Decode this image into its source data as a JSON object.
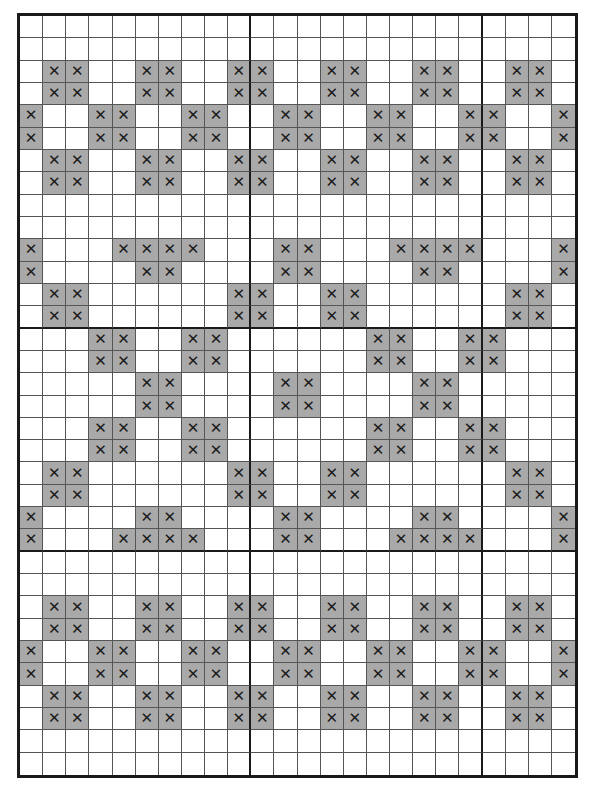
{
  "chart": {
    "type": "cross-stitch-pattern",
    "columns": 24,
    "rows": 34,
    "symbol": "✕",
    "colors": {
      "filled": "#a9a9a9",
      "empty": "#ffffff",
      "grid": "#555555",
      "major_grid": "#1a1a1a"
    },
    "major_lines": {
      "after_columns": [
        9,
        19
      ],
      "after_rows": [
        13,
        23
      ]
    },
    "pattern": [
      "........................",
      "........................",
      ".XX..XX..XX..XX..XX..XX.",
      ".XX..XX..XX..XX..XX..XX.",
      "X..XX..XX..XX..XX..XX..X",
      "X..XX..XX..XX..XX..XX..X",
      ".XX..XX..XX..XX..XX..XX.",
      ".XX..XX..XX..XX..XX..XX.",
      "........................",
      "........................",
      "X...XXXX...XX...XXXX...X",
      "X....XX....XX....XX....X",
      ".XX......XX..XX......XX.",
      ".XX......XX..XX......XX.",
      "...XX..XX......XX..XX...",
      "...XX..XX......XX..XX...",
      ".....XX....XX....XX.....",
      ".....XX....XX....XX.....",
      "...XX..XX......XX..XX...",
      "...XX..XX......XX..XX...",
      ".XX......XX..XX......XX.",
      ".XX......XX..XX......XX.",
      "X....XX....XX....XX....X",
      "X...XXXX...XX...XXXX...X",
      "........................",
      "........................",
      ".XX..XX..XX..XX..XX..XX.",
      ".XX..XX..XX..XX..XX..XX.",
      "X..XX..XX..XX..XX..XX..X",
      "X..XX..XX..XX..XX..XX..X",
      ".XX..XX..XX..XX..XX..XX.",
      ".XX..XX..XX..XX..XX..XX.",
      "........................",
      "........................"
    ]
  }
}
